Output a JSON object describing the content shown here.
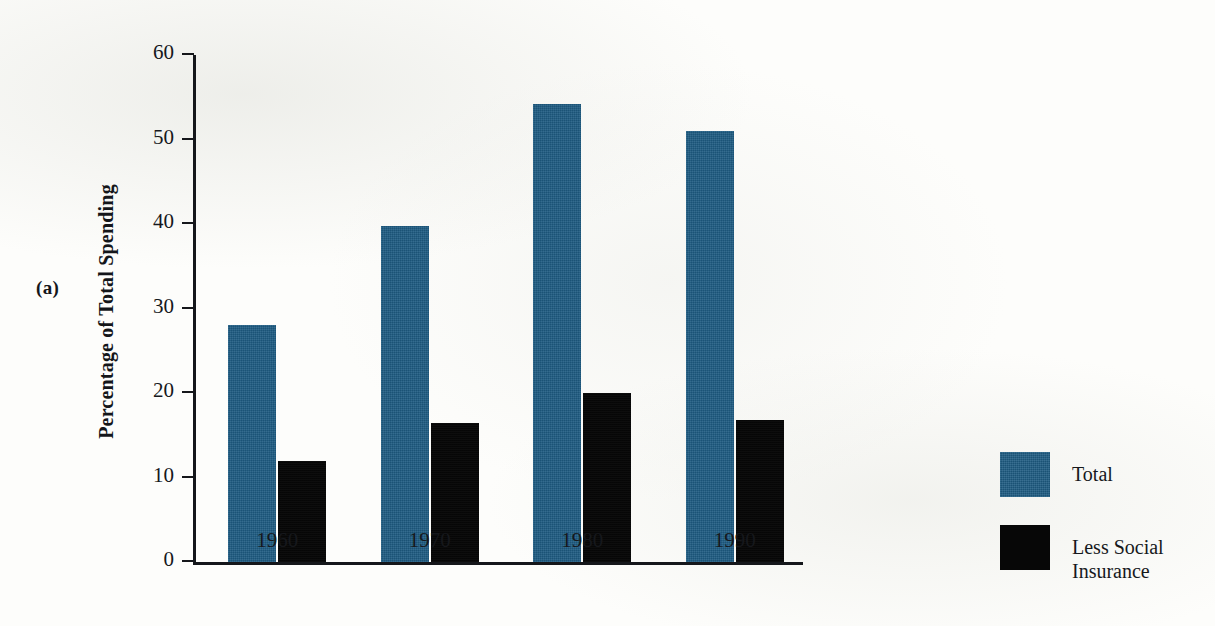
{
  "figure": {
    "panel_label": "(a)",
    "background_color": "#fdfdfb"
  },
  "chart_data": {
    "type": "bar",
    "title": "",
    "subtitle": "",
    "xlabel": "",
    "ylabel": "Percentage of Total Spending",
    "categories": [
      "1960",
      "1970",
      "1980",
      "1990"
    ],
    "series": [
      {
        "name": "Total",
        "color": "#1d5b82",
        "values": [
          28,
          39.8,
          54.2,
          51
        ]
      },
      {
        "name": "Less Social Insurance",
        "color": "#080808",
        "values": [
          12,
          16.4,
          20,
          16.8
        ]
      }
    ],
    "ylim": [
      0,
      60
    ],
    "yticks": [
      0,
      10,
      20,
      30,
      40,
      50,
      60
    ],
    "ytick_labels": [
      "0",
      "10",
      "20",
      "30",
      "40",
      "50",
      "60"
    ],
    "grid": false,
    "legend_position": "right",
    "legend": [
      {
        "label": "Total",
        "label_line1": "Total",
        "label_line2": "",
        "color": "#1d5b82"
      },
      {
        "label": "Less Social Insurance",
        "label_line1": "Less Social",
        "label_line2": "Insurance",
        "color": "#080808"
      }
    ]
  }
}
